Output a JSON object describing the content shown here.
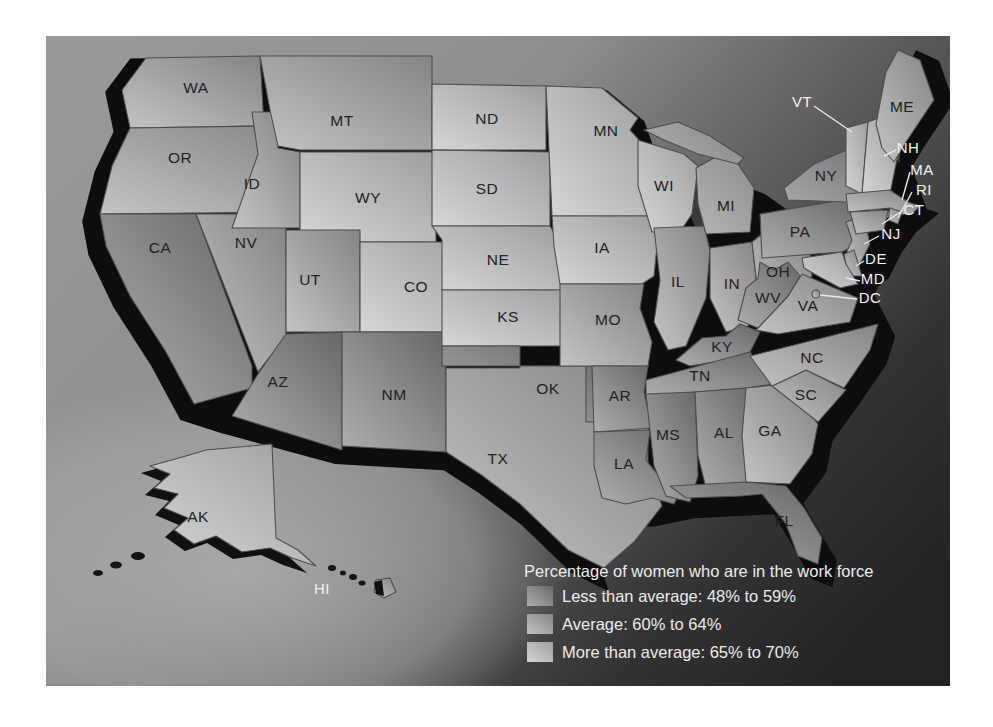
{
  "legend": {
    "title": "Percentage of women who are in the work force",
    "items": [
      {
        "label": "Less than average: 48% to 59%",
        "category": "less"
      },
      {
        "label": "Average: 60% to 64%",
        "category": "average"
      },
      {
        "label": "More than average: 65% to 70%",
        "category": "more"
      }
    ]
  },
  "colors": {
    "less_light": "#aeaeae",
    "less_dark": "#686868",
    "average_light": "#c3c3c3",
    "average_dark": "#848484",
    "more_light": "#d6d6d6",
    "more_dark": "#9e9e9e",
    "coast_shadow": "#0d0d0d",
    "state_border": "#4e4e4e",
    "label_dark": "#222222",
    "label_light": "#f2f2f2"
  },
  "map": {
    "states": [
      {
        "abbr": "WA",
        "name": "Washington",
        "category": "average"
      },
      {
        "abbr": "OR",
        "name": "Oregon",
        "category": "average"
      },
      {
        "abbr": "CA",
        "name": "California",
        "category": "less"
      },
      {
        "abbr": "NV",
        "name": "Nevada",
        "category": "average"
      },
      {
        "abbr": "ID",
        "name": "Idaho",
        "category": "average"
      },
      {
        "abbr": "MT",
        "name": "Montana",
        "category": "average"
      },
      {
        "abbr": "WY",
        "name": "Wyoming",
        "category": "more"
      },
      {
        "abbr": "UT",
        "name": "Utah",
        "category": "average"
      },
      {
        "abbr": "CO",
        "name": "Colorado",
        "category": "more"
      },
      {
        "abbr": "AZ",
        "name": "Arizona",
        "category": "less"
      },
      {
        "abbr": "NM",
        "name": "New Mexico",
        "category": "less"
      },
      {
        "abbr": "ND",
        "name": "North Dakota",
        "category": "more"
      },
      {
        "abbr": "SD",
        "name": "South Dakota",
        "category": "more"
      },
      {
        "abbr": "NE",
        "name": "Nebraska",
        "category": "more"
      },
      {
        "abbr": "KS",
        "name": "Kansas",
        "category": "more"
      },
      {
        "abbr": "OK",
        "name": "Oklahoma",
        "category": "less"
      },
      {
        "abbr": "TX",
        "name": "Texas",
        "category": "average"
      },
      {
        "abbr": "MN",
        "name": "Minnesota",
        "category": "more"
      },
      {
        "abbr": "IA",
        "name": "Iowa",
        "category": "more"
      },
      {
        "abbr": "MO",
        "name": "Missouri",
        "category": "average"
      },
      {
        "abbr": "AR",
        "name": "Arkansas",
        "category": "less"
      },
      {
        "abbr": "LA",
        "name": "Louisiana",
        "category": "less"
      },
      {
        "abbr": "WI",
        "name": "Wisconsin",
        "category": "more"
      },
      {
        "abbr": "IL",
        "name": "Illinois",
        "category": "average"
      },
      {
        "abbr": "MI",
        "name": "Michigan",
        "category": "average"
      },
      {
        "abbr": "IN",
        "name": "Indiana",
        "category": "average"
      },
      {
        "abbr": "OH",
        "name": "Ohio",
        "category": "average"
      },
      {
        "abbr": "KY",
        "name": "Kentucky",
        "category": "less"
      },
      {
        "abbr": "TN",
        "name": "Tennessee",
        "category": "less"
      },
      {
        "abbr": "MS",
        "name": "Mississippi",
        "category": "less"
      },
      {
        "abbr": "AL",
        "name": "Alabama",
        "category": "less"
      },
      {
        "abbr": "GA",
        "name": "Georgia",
        "category": "average"
      },
      {
        "abbr": "FL",
        "name": "Florida",
        "category": "less"
      },
      {
        "abbr": "SC",
        "name": "South Carolina",
        "category": "average"
      },
      {
        "abbr": "NC",
        "name": "North Carolina",
        "category": "average"
      },
      {
        "abbr": "VA",
        "name": "Virginia",
        "category": "average"
      },
      {
        "abbr": "WV",
        "name": "West Virginia",
        "category": "less"
      },
      {
        "abbr": "PA",
        "name": "Pennsylvania",
        "category": "less"
      },
      {
        "abbr": "NY",
        "name": "New York",
        "category": "less"
      },
      {
        "abbr": "NJ",
        "name": "New Jersey",
        "category": "average"
      },
      {
        "abbr": "DE",
        "name": "Delaware",
        "category": "average"
      },
      {
        "abbr": "MD",
        "name": "Maryland",
        "category": "more"
      },
      {
        "abbr": "DC",
        "name": "District of Columbia",
        "category": "average"
      },
      {
        "abbr": "VT",
        "name": "Vermont",
        "category": "more"
      },
      {
        "abbr": "NH",
        "name": "New Hampshire",
        "category": "more"
      },
      {
        "abbr": "MA",
        "name": "Massachusetts",
        "category": "average"
      },
      {
        "abbr": "RI",
        "name": "Rhode Island",
        "category": "average"
      },
      {
        "abbr": "CT",
        "name": "Connecticut",
        "category": "average"
      },
      {
        "abbr": "ME",
        "name": "Maine",
        "category": "average"
      },
      {
        "abbr": "AK",
        "name": "Alaska",
        "category": "more"
      },
      {
        "abbr": "HI",
        "name": "Hawaii",
        "category": "average"
      }
    ]
  }
}
